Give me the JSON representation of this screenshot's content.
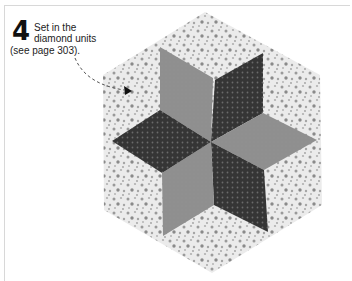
{
  "instruction": {
    "step_number": "4",
    "line1": "Set in the",
    "line2": "diamond units",
    "line3": "(see page 303)."
  },
  "illustration": {
    "subject": "eight-pointed-star hexagon quilt block",
    "colors": {
      "background_print": "#e6e6e6",
      "background_dots": "#9a9a9a",
      "light_diamond": "#8e8e8e",
      "dark_diamond": "#3a3a3a",
      "dark_dots": "#5c5c5c"
    }
  }
}
